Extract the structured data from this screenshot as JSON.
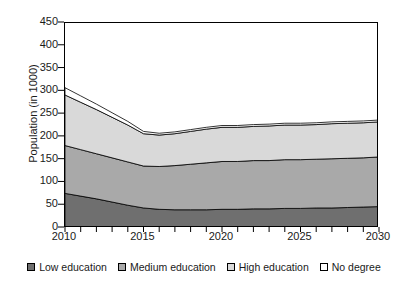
{
  "chart_data": {
    "type": "area",
    "stacked": true,
    "title": "",
    "xlabel": "",
    "ylabel": "Population (in 1000)",
    "xlim": [
      2010,
      2030
    ],
    "ylim": [
      0,
      450
    ],
    "ytick_step": 50,
    "xtick_step": 1,
    "grid": false,
    "legend_position": "bottom",
    "yticks": [
      0,
      50,
      100,
      150,
      200,
      250,
      300,
      350,
      400,
      450
    ],
    "ytick_labels": [
      "0",
      "50",
      "100",
      "150",
      "200",
      "250",
      "300",
      "350",
      "400",
      "450"
    ],
    "xticks": [
      2010,
      2011,
      2012,
      2013,
      2014,
      2015,
      2016,
      2017,
      2018,
      2019,
      2020,
      2021,
      2022,
      2023,
      2024,
      2025,
      2026,
      2027,
      2028,
      2029,
      2030
    ],
    "xtick_labels_shown": [
      "2010",
      "2015",
      "2020",
      "2025",
      "2030"
    ],
    "xtick_labels_shown_at": [
      2010,
      2015,
      2020,
      2025,
      2030
    ],
    "x": [
      2010,
      2011,
      2012,
      2013,
      2014,
      2015,
      2016,
      2017,
      2018,
      2019,
      2020,
      2021,
      2022,
      2023,
      2024,
      2025,
      2026,
      2027,
      2028,
      2029,
      2030
    ],
    "series": [
      {
        "name": "Low education",
        "color": "#6f6f6f",
        "values": [
          76,
          70,
          64,
          57,
          50,
          44,
          41,
          40,
          40,
          40,
          41,
          41,
          42,
          42,
          43,
          43,
          44,
          44,
          45,
          46,
          47
        ]
      },
      {
        "name": "Medium education",
        "color": "#a9a9a9",
        "values": [
          105,
          102,
          99,
          97,
          95,
          92,
          94,
          97,
          100,
          103,
          105,
          105,
          106,
          106,
          107,
          107,
          107,
          108,
          108,
          108,
          109
        ]
      },
      {
        "name": "High education",
        "color": "#d9d9d9",
        "values": [
          111,
          104,
          97,
          89,
          81,
          71,
          69,
          70,
          72,
          74,
          75,
          75,
          75,
          76,
          76,
          76,
          76,
          77,
          77,
          77,
          77
        ]
      },
      {
        "name": "No degree",
        "color": "#ffffff",
        "values": [
          16,
          14,
          12,
          10,
          8,
          5,
          4,
          4,
          4,
          4,
          4,
          4,
          4,
          4,
          4,
          4,
          4,
          4,
          4,
          4,
          4
        ]
      }
    ],
    "cumulative_totals": [
      308,
      290,
      272,
      253,
      234,
      212,
      208,
      211,
      216,
      221,
      225,
      225,
      227,
      228,
      230,
      230,
      231,
      233,
      234,
      235,
      237
    ],
    "series_boundary_notes": {
      "total_2010": 385,
      "total_2015_2016_min": 208,
      "total_2030": 237
    }
  },
  "legend": {
    "items": [
      {
        "label": "Low education",
        "color": "#6f6f6f",
        "icon": "legend-swatch-icon"
      },
      {
        "label": "Medium education",
        "color": "#a9a9a9",
        "icon": "legend-swatch-icon"
      },
      {
        "label": "High education",
        "color": "#d9d9d9",
        "icon": "legend-swatch-icon"
      },
      {
        "label": "No degree",
        "color": "#ffffff",
        "icon": "legend-swatch-icon"
      }
    ]
  }
}
